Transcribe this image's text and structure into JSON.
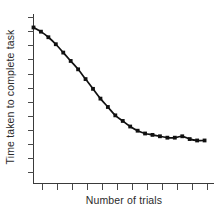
{
  "chart_data": {
    "type": "line",
    "title": "",
    "subtitle": "",
    "xlabel": "Number of trials",
    "ylabel": "Time taken to complete task",
    "grid": false,
    "legend": null,
    "legend_position": "none",
    "x_tick_labels": [],
    "y_tick_labels": [],
    "x_tick_count": 12,
    "y_tick_count": 12,
    "xlim": [
      0,
      24
    ],
    "ylim": [
      0,
      100
    ],
    "annotations": [],
    "series": [
      {
        "name": "Time taken to complete task",
        "color": "#111111",
        "marker": "square",
        "x": [
          0,
          1,
          2,
          3,
          4,
          5,
          6,
          7,
          8,
          9,
          10,
          11,
          12,
          13,
          14,
          15,
          16,
          17,
          18,
          19,
          20,
          21,
          22,
          23
        ],
        "y": [
          95,
          92,
          88,
          83,
          77,
          71,
          65,
          58,
          51,
          44,
          38,
          32,
          28,
          24,
          21,
          19,
          18,
          17,
          16,
          16,
          17,
          15,
          14,
          14
        ]
      }
    ]
  },
  "figure": {
    "background_color": "#ffffff",
    "line_color": "#111111",
    "axis_color": "#3a3a3a",
    "text_color": "#2b2b2b"
  }
}
